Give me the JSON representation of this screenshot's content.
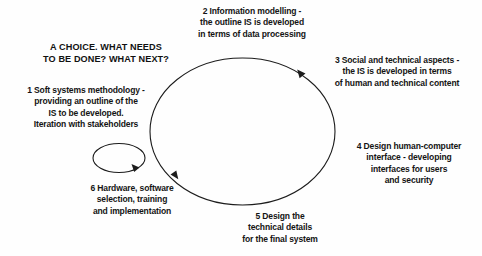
{
  "diagram": {
    "title": "A CHOICE. WHAT NEEDS\nTO BE DONE? WHAT NEXT?",
    "type": "cycle-diagram",
    "shapes": {
      "main_cycle": "large-ellipse",
      "iteration_loop": "small-ellipse",
      "stroke_color": "#1c1c1c",
      "background_color": "#fefefe"
    },
    "steps": [
      {
        "number": "1",
        "text": "1 Soft systems methodology -\nproviding an outline of the\nIS to be developed.\nIteration with stakeholders"
      },
      {
        "number": "2",
        "text": "2 Information modelling -\nthe outline IS is developed\nin terms of data processing"
      },
      {
        "number": "3",
        "text": "3 Social and technical aspects -\nthe IS is developed in terms\nof human and technical content"
      },
      {
        "number": "4",
        "text": "4 Design human-computer\ninterface - developing\ninterfaces for users\nand security"
      },
      {
        "number": "5",
        "text": "5 Design the\ntechnical details\nfor the final system"
      },
      {
        "number": "6",
        "text": "6 Hardware, software\nselection, training\nand implementation"
      }
    ]
  }
}
